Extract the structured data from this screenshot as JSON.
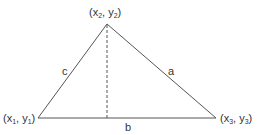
{
  "diagram": {
    "type": "triangle-with-altitude",
    "vertices": [
      {
        "id": "v1",
        "label_x": "x",
        "sub": "1",
        "label_y": "y",
        "position": "bottom-left"
      },
      {
        "id": "v2",
        "label_x": "x",
        "sub": "2",
        "label_y": "y",
        "position": "top"
      },
      {
        "id": "v3",
        "label_x": "x",
        "sub": "3",
        "label_y": "y",
        "position": "bottom-right"
      }
    ],
    "sides": {
      "a": "a",
      "b": "b",
      "c": "c"
    },
    "altitude_style": "dashed",
    "colors": {
      "line": "#555555",
      "text": "#333333",
      "background": "#ffffff"
    }
  }
}
